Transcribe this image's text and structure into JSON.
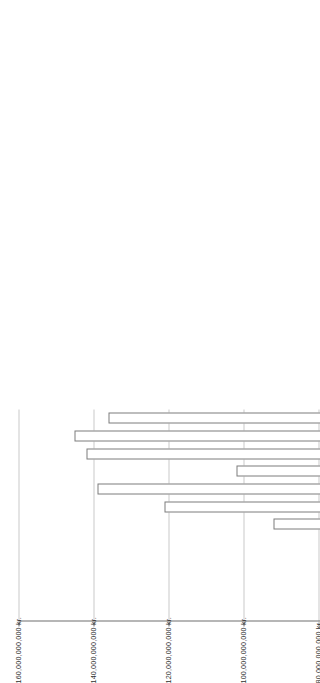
{
  "chart": {
    "type": "bar",
    "orientation": "rotated-horizontal-stacked",
    "title": "",
    "xlabel": "1923",
    "ylabel": "",
    "axis_title": "1923",
    "grid": true,
    "legend_position": "none"
  },
  "axis": {
    "unit_suffix": "kr.",
    "ylim": [
      0,
      160000000000
    ],
    "tick_values": [
      0,
      20000000000,
      40000000000,
      60000000000,
      80000000000,
      100000000000,
      120000000000,
      140000000000,
      160000000000
    ],
    "tick_labels": [
      "0 kr.",
      "20,000,000,000 kr.",
      "40,000,000,000 kr.",
      "60,000,000,000 kr.",
      "80,000,000,000 kr.",
      "100,000,000,000 kr.",
      "120,000,000,000 kr.",
      "140,000,000,000 kr.",
      "160,000,000,000 kr."
    ]
  },
  "colors": {
    "series_1": "#3f3f3f",
    "series_2": "#8c8c8c",
    "series_3": "#d2d2d2",
    "series_4": "#ffffff",
    "border": "#7c7c7c",
    "grid": "#c9c9c9",
    "axis": "#6f6f6f",
    "text": "#2f2f2f",
    "background": "#ffffff"
  },
  "chart_data": {
    "type": "bar",
    "title": "",
    "xlabel": "1923",
    "ylabel": "",
    "ylim": [
      0,
      160000000000
    ],
    "grid": true,
    "legend_position": "none",
    "stacked": true,
    "categories": [
      "Jan",
      "Feb",
      "Mar",
      "Apr",
      "May",
      "Jun",
      "Jul",
      "Aug",
      "Sep",
      "Oct",
      "Nov",
      "Dec"
    ],
    "series": [
      {
        "name": "Series 1",
        "color": "#3f3f3f",
        "values": [
          7000000000,
          10000000000,
          8000000000,
          11000000000,
          25000000000,
          13000000000,
          24000000000,
          30000000000,
          26000000000,
          28000000000,
          27000000000,
          13000000000
        ]
      },
      {
        "name": "Series 2",
        "color": "#8c8c8c",
        "values": [
          7000000000,
          7000000000,
          7000000000,
          7000000000,
          6000000000,
          6000000000,
          10000000000,
          11000000000,
          8000000000,
          9000000000,
          11000000000,
          9000000000
        ]
      },
      {
        "name": "Series 3",
        "color": "#d2d2d2",
        "values": [
          11000000000,
          10000000000,
          12000000000,
          10000000000,
          10000000000,
          11000000000,
          17000000000,
          19000000000,
          16000000000,
          20000000000,
          15000000000,
          14000000000
        ]
      },
      {
        "name": "Series 4",
        "color": "#ffffff",
        "values": [
          0,
          0,
          0,
          1000000000,
          13000000000,
          62000000000,
          70000000000,
          79000000000,
          52000000000,
          85000000000,
          92000000000,
          100000000000
        ]
      }
    ],
    "totals": [
      25000000000,
      27000000000,
      27000000000,
      29000000000,
      54000000000,
      92000000000,
      121000000000,
      139000000000,
      102000000000,
      142000000000,
      145000000000,
      136000000000
    ]
  }
}
